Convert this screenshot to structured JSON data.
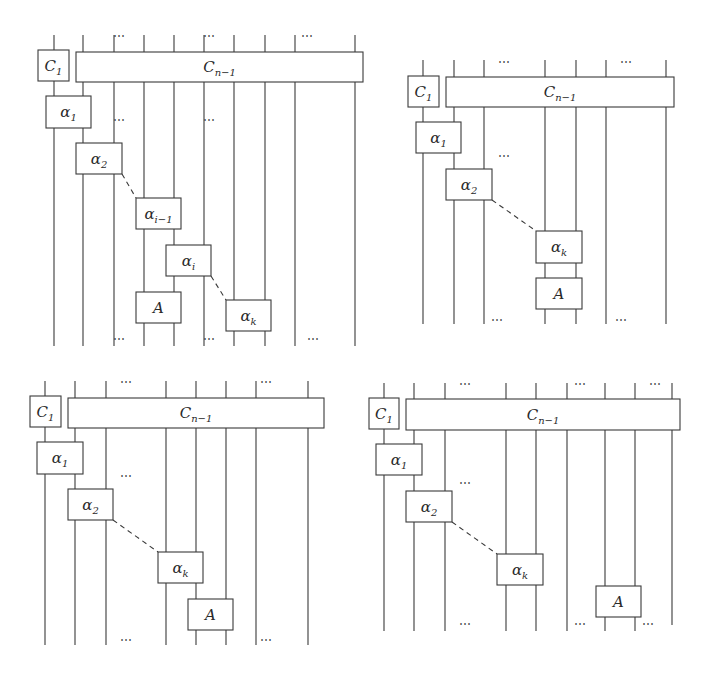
{
  "figure": {
    "panels": [
      {
        "id": "top-left",
        "wires": [
          {
            "x": 54,
            "y1": 35,
            "y2": 346
          },
          {
            "x": 83,
            "y1": 35,
            "y2": 346
          },
          {
            "x": 114,
            "y1": 35,
            "y2": 346
          },
          {
            "x": 144,
            "y1": 35,
            "y2": 346
          },
          {
            "x": 174,
            "y1": 35,
            "y2": 346
          },
          {
            "x": 204,
            "y1": 35,
            "y2": 346
          },
          {
            "x": 234,
            "y1": 35,
            "y2": 346
          },
          {
            "x": 265,
            "y1": 35,
            "y2": 346
          },
          {
            "x": 295,
            "y1": 35,
            "y2": 346
          },
          {
            "x": 355,
            "y1": 35,
            "y2": 346
          }
        ],
        "boxes": [
          {
            "name": "c1-box",
            "x": 38,
            "y": 50,
            "w": 31,
            "h": 31,
            "label": "C",
            "sub": "1"
          },
          {
            "name": "cn-1-box",
            "x": 76,
            "y": 52,
            "w": 287,
            "h": 30,
            "label": "C",
            "sub": "n−1"
          },
          {
            "name": "alpha-1-box",
            "x": 46,
            "y": 96,
            "w": 45,
            "h": 32,
            "label": "α",
            "sub": "1"
          },
          {
            "name": "alpha-2-box",
            "x": 76,
            "y": 143,
            "w": 46,
            "h": 31,
            "label": "α",
            "sub": "2"
          },
          {
            "name": "alpha-i-1-box",
            "x": 136,
            "y": 198,
            "w": 45,
            "h": 31,
            "label": "α",
            "sub": "i−1"
          },
          {
            "name": "alpha-i-box",
            "x": 166,
            "y": 245,
            "w": 45,
            "h": 31,
            "label": "α",
            "sub": "i"
          },
          {
            "name": "a-box",
            "x": 136,
            "y": 292,
            "w": 45,
            "h": 31,
            "label": "A",
            "sub": ""
          },
          {
            "name": "alpha-k-box",
            "x": 226,
            "y": 300,
            "w": 45,
            "h": 31,
            "label": "α",
            "sub": "k"
          }
        ],
        "dashes": [
          {
            "x1": 122,
            "y1": 174,
            "x2": 136,
            "y2": 198
          },
          {
            "x1": 211,
            "y1": 276,
            "x2": 226,
            "y2": 300
          }
        ],
        "dots": [
          {
            "x": 119,
            "y": 40
          },
          {
            "x": 209,
            "y": 40
          },
          {
            "x": 307,
            "y": 40
          },
          {
            "x": 119,
            "y": 124
          },
          {
            "x": 209,
            "y": 124
          },
          {
            "x": 119,
            "y": 343
          },
          {
            "x": 209,
            "y": 343
          },
          {
            "x": 313,
            "y": 343
          }
        ]
      },
      {
        "id": "top-right",
        "wires": [
          {
            "x": 423,
            "y1": 60,
            "y2": 324
          },
          {
            "x": 454,
            "y1": 60,
            "y2": 324
          },
          {
            "x": 484,
            "y1": 60,
            "y2": 324
          },
          {
            "x": 545,
            "y1": 60,
            "y2": 324
          },
          {
            "x": 576,
            "y1": 60,
            "y2": 324
          },
          {
            "x": 606,
            "y1": 60,
            "y2": 324
          },
          {
            "x": 666,
            "y1": 60,
            "y2": 324
          }
        ],
        "boxes": [
          {
            "name": "c1-box",
            "x": 408,
            "y": 76,
            "w": 31,
            "h": 31,
            "label": "C",
            "sub": "1"
          },
          {
            "name": "cn-1-box",
            "x": 446,
            "y": 77,
            "w": 228,
            "h": 30,
            "label": "C",
            "sub": "n−1"
          },
          {
            "name": "alpha-1-box",
            "x": 416,
            "y": 122,
            "w": 45,
            "h": 31,
            "label": "α",
            "sub": "1"
          },
          {
            "name": "alpha-2-box",
            "x": 446,
            "y": 169,
            "w": 46,
            "h": 31,
            "label": "α",
            "sub": "2"
          },
          {
            "name": "alpha-k-box",
            "x": 536,
            "y": 231,
            "w": 46,
            "h": 32,
            "label": "α",
            "sub": "k"
          },
          {
            "name": "a-box",
            "x": 536,
            "y": 278,
            "w": 46,
            "h": 31,
            "label": "A",
            "sub": ""
          }
        ],
        "dashes": [
          {
            "x1": 492,
            "y1": 200,
            "x2": 536,
            "y2": 231
          }
        ],
        "dots": [
          {
            "x": 504,
            "y": 66
          },
          {
            "x": 626,
            "y": 66
          },
          {
            "x": 504,
            "y": 160
          },
          {
            "x": 497,
            "y": 324
          },
          {
            "x": 621,
            "y": 324
          }
        ]
      },
      {
        "id": "bottom-left",
        "wires": [
          {
            "x": 45,
            "y1": 381,
            "y2": 645
          },
          {
            "x": 75,
            "y1": 381,
            "y2": 645
          },
          {
            "x": 106,
            "y1": 381,
            "y2": 645
          },
          {
            "x": 166,
            "y1": 381,
            "y2": 645
          },
          {
            "x": 196,
            "y1": 381,
            "y2": 645
          },
          {
            "x": 226,
            "y1": 381,
            "y2": 645
          },
          {
            "x": 256,
            "y1": 381,
            "y2": 645
          },
          {
            "x": 308,
            "y1": 381,
            "y2": 645
          }
        ],
        "boxes": [
          {
            "name": "c1-box",
            "x": 30,
            "y": 396,
            "w": 31,
            "h": 31,
            "label": "C",
            "sub": "1"
          },
          {
            "name": "cn-1-box",
            "x": 68,
            "y": 398,
            "w": 256,
            "h": 30,
            "label": "C",
            "sub": "n−1"
          },
          {
            "name": "alpha-1-box",
            "x": 37,
            "y": 442,
            "w": 46,
            "h": 32,
            "label": "α",
            "sub": "1"
          },
          {
            "name": "alpha-2-box",
            "x": 68,
            "y": 489,
            "w": 45,
            "h": 31,
            "label": "α",
            "sub": "2"
          },
          {
            "name": "alpha-k-box",
            "x": 158,
            "y": 552,
            "w": 45,
            "h": 31,
            "label": "α",
            "sub": "k"
          },
          {
            "name": "a-box",
            "x": 188,
            "y": 599,
            "w": 45,
            "h": 31,
            "label": "A",
            "sub": ""
          }
        ],
        "dashes": [
          {
            "x1": 113,
            "y1": 520,
            "x2": 158,
            "y2": 552
          }
        ],
        "dots": [
          {
            "x": 126,
            "y": 386
          },
          {
            "x": 266,
            "y": 386
          },
          {
            "x": 126,
            "y": 480
          },
          {
            "x": 126,
            "y": 644
          },
          {
            "x": 266,
            "y": 644
          }
        ]
      },
      {
        "id": "bottom-right",
        "wires": [
          {
            "x": 384,
            "y1": 383,
            "y2": 631
          },
          {
            "x": 414,
            "y1": 383,
            "y2": 631
          },
          {
            "x": 445,
            "y1": 383,
            "y2": 631
          },
          {
            "x": 506,
            "y1": 383,
            "y2": 631
          },
          {
            "x": 536,
            "y1": 383,
            "y2": 631
          },
          {
            "x": 567,
            "y1": 383,
            "y2": 631
          },
          {
            "x": 605,
            "y1": 383,
            "y2": 631
          },
          {
            "x": 635,
            "y1": 383,
            "y2": 631
          },
          {
            "x": 672,
            "y1": 383,
            "y2": 625
          }
        ],
        "boxes": [
          {
            "name": "c1-box",
            "x": 369,
            "y": 398,
            "w": 30,
            "h": 31,
            "label": "C",
            "sub": "1"
          },
          {
            "name": "cn-1-box",
            "x": 406,
            "y": 399,
            "w": 274,
            "h": 31,
            "label": "C",
            "sub": "n−1"
          },
          {
            "name": "alpha-1-box",
            "x": 376,
            "y": 444,
            "w": 46,
            "h": 31,
            "label": "α",
            "sub": "1"
          },
          {
            "name": "alpha-2-box",
            "x": 406,
            "y": 491,
            "w": 46,
            "h": 31,
            "label": "α",
            "sub": "2"
          },
          {
            "name": "alpha-k-box",
            "x": 497,
            "y": 554,
            "w": 46,
            "h": 31,
            "label": "α",
            "sub": "k"
          },
          {
            "name": "a-box",
            "x": 596,
            "y": 586,
            "w": 45,
            "h": 31,
            "label": "A",
            "sub": ""
          }
        ],
        "dashes": [
          {
            "x1": 452,
            "y1": 522,
            "x2": 497,
            "y2": 554
          }
        ],
        "dots": [
          {
            "x": 465,
            "y": 388
          },
          {
            "x": 580,
            "y": 388
          },
          {
            "x": 655,
            "y": 388
          },
          {
            "x": 465,
            "y": 487
          },
          {
            "x": 465,
            "y": 628
          },
          {
            "x": 580,
            "y": 628
          },
          {
            "x": 648,
            "y": 628
          }
        ]
      }
    ],
    "ellipsis": "⋯"
  }
}
